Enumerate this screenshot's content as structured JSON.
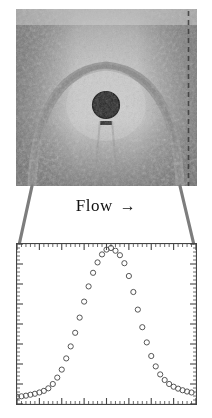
{
  "figure": {
    "caption_text": "Flow",
    "arrow_glyph": "→",
    "photo": {
      "description": "schlieren-photograph-bow-shock-over-sphere",
      "background_color": "#b9b9b9",
      "shock_color": "#8b8b8b",
      "sphere_color": "#2a2a2a"
    }
  },
  "chart_data": {
    "type": "scatter",
    "title": "",
    "xlabel": "",
    "ylabel": "",
    "xlim": [
      0,
      40
    ],
    "ylim": [
      0,
      1
    ],
    "grid": false,
    "legend": null,
    "marker": "open-circle",
    "marker_color": "#555555",
    "axis_color": "#444444",
    "frame": "box",
    "ticks": {
      "x_major_count": 8,
      "x_minor_per_major": 5,
      "y_major_count": 8,
      "y_minor_per_major": 5,
      "direction": "inward"
    },
    "x": [
      0,
      1,
      2,
      3,
      4,
      5,
      6,
      7,
      8,
      9,
      10,
      11,
      12,
      13,
      14,
      15,
      16,
      17,
      18,
      19,
      20,
      21,
      22,
      23,
      24,
      25,
      26,
      27,
      28,
      29,
      30,
      31,
      32,
      33,
      34,
      35,
      36,
      37,
      38,
      39
    ],
    "values": [
      0.045,
      0.048,
      0.052,
      0.058,
      0.064,
      0.072,
      0.082,
      0.098,
      0.125,
      0.165,
      0.215,
      0.285,
      0.36,
      0.445,
      0.54,
      0.64,
      0.735,
      0.82,
      0.885,
      0.935,
      0.965,
      0.975,
      0.958,
      0.93,
      0.88,
      0.8,
      0.7,
      0.59,
      0.48,
      0.385,
      0.3,
      0.235,
      0.185,
      0.15,
      0.125,
      0.108,
      0.096,
      0.086,
      0.078,
      0.072
    ],
    "series": [
      {
        "name": "profile",
        "values": [
          0.045,
          0.048,
          0.052,
          0.058,
          0.064,
          0.072,
          0.082,
          0.098,
          0.125,
          0.165,
          0.215,
          0.285,
          0.36,
          0.445,
          0.54,
          0.64,
          0.735,
          0.82,
          0.885,
          0.935,
          0.965,
          0.975,
          0.958,
          0.93,
          0.88,
          0.8,
          0.7,
          0.59,
          0.48,
          0.385,
          0.3,
          0.235,
          0.185,
          0.15,
          0.125,
          0.108,
          0.096,
          0.086,
          0.078,
          0.072
        ]
      }
    ]
  }
}
